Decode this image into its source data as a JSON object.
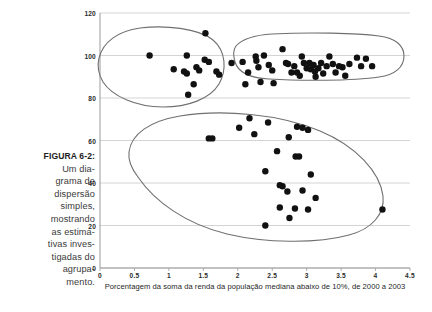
{
  "figure": {
    "caption_label": "FIGURA 6-2:",
    "caption_text": "Um diagrama de dispersão simples, mostrando as estimativas investigadas do agrupamento.",
    "caption_lines": [
      "Um dia-",
      "grama de",
      "dispersão",
      "simples,",
      "mostrando",
      "as estima-",
      "tivas inves-",
      "tigadas do",
      "agrupa-",
      "mento."
    ]
  },
  "colors": {
    "background": "#ffffff",
    "gridline": "#c9c9c9",
    "axis": "#9a9a9a",
    "point": "#111111",
    "cluster_outline": "#6f6f6f",
    "text": "#2b2b2b",
    "caption_text": "#3a3a3a"
  },
  "chart_data": {
    "type": "scatter",
    "title": "",
    "subtitle": "",
    "xlabel": "Porcentagem da soma da renda da população mediana abaixo de 10%, de 2000 a 2003",
    "ylabel": "",
    "xlim": [
      0,
      4.5
    ],
    "ylim": [
      0,
      120
    ],
    "xticks": [
      0,
      0.5,
      1,
      1.5,
      2,
      2.5,
      3,
      3.5,
      4,
      4.5
    ],
    "xtick_labels": [
      "0",
      "0.5",
      "1",
      "1.5",
      "2",
      "2.5",
      "3",
      "3.5",
      "4",
      "4.5"
    ],
    "yticks": [
      0,
      20,
      40,
      60,
      80,
      100,
      120
    ],
    "ytick_labels": [
      "0",
      "20",
      "40",
      "60",
      "80",
      "100",
      "120"
    ],
    "grid": "horizontal",
    "legend": "none",
    "marker": "filled-circle",
    "marker_size": 3.2,
    "series": [
      {
        "name": "estimativas",
        "points": [
          [
            0.72,
            100.0
          ],
          [
            1.53,
            110.5
          ],
          [
            1.26,
            100.0
          ],
          [
            1.52,
            98.0
          ],
          [
            1.58,
            97.0
          ],
          [
            1.91,
            96.5
          ],
          [
            2.07,
            97.0
          ],
          [
            1.07,
            93.5
          ],
          [
            1.22,
            92.5
          ],
          [
            1.26,
            91.5
          ],
          [
            1.4,
            94.5
          ],
          [
            1.44,
            93.0
          ],
          [
            1.69,
            92.5
          ],
          [
            1.73,
            91.0
          ],
          [
            2.15,
            92.0
          ],
          [
            1.36,
            86.5
          ],
          [
            2.11,
            86.5
          ],
          [
            1.28,
            81.5
          ],
          [
            2.26,
            99.5
          ],
          [
            2.27,
            97.5
          ],
          [
            2.3,
            94.5
          ],
          [
            2.33,
            87.5
          ],
          [
            2.38,
            100.0
          ],
          [
            2.45,
            95.5
          ],
          [
            2.5,
            93.0
          ],
          [
            2.52,
            87.0
          ],
          [
            2.65,
            103.0
          ],
          [
            2.7,
            96.5
          ],
          [
            2.73,
            96.0
          ],
          [
            2.78,
            92.0
          ],
          [
            2.82,
            95.0
          ],
          [
            2.86,
            92.0
          ],
          [
            2.9,
            90.5
          ],
          [
            2.93,
            99.5
          ],
          [
            2.96,
            96.5
          ],
          [
            3.0,
            94.0
          ],
          [
            3.04,
            96.5
          ],
          [
            3.06,
            93.5
          ],
          [
            3.1,
            95.5
          ],
          [
            3.12,
            92.5
          ],
          [
            3.13,
            90.0
          ],
          [
            3.17,
            94.0
          ],
          [
            3.21,
            96.5
          ],
          [
            3.24,
            91.5
          ],
          [
            3.29,
            95.0
          ],
          [
            3.33,
            99.5
          ],
          [
            3.38,
            96.0
          ],
          [
            3.42,
            92.0
          ],
          [
            3.47,
            95.0
          ],
          [
            3.52,
            94.5
          ],
          [
            3.56,
            90.5
          ],
          [
            3.62,
            96.0
          ],
          [
            3.73,
            99.0
          ],
          [
            3.79,
            95.0
          ],
          [
            3.86,
            98.5
          ],
          [
            3.95,
            95.0
          ],
          [
            1.58,
            61.0
          ],
          [
            1.63,
            61.0
          ],
          [
            2.02,
            66.0
          ],
          [
            2.24,
            63.0
          ],
          [
            2.17,
            70.5
          ],
          [
            2.44,
            68.5
          ],
          [
            2.86,
            66.5
          ],
          [
            2.94,
            66.0
          ],
          [
            3.02,
            65.0
          ],
          [
            2.74,
            61.5
          ],
          [
            2.57,
            55.0
          ],
          [
            2.84,
            52.5
          ],
          [
            2.89,
            52.5
          ],
          [
            2.4,
            45.5
          ],
          [
            3.06,
            44.0
          ],
          [
            2.61,
            39.0
          ],
          [
            2.65,
            38.5
          ],
          [
            2.72,
            36.0
          ],
          [
            2.94,
            36.5
          ],
          [
            3.13,
            33.0
          ],
          [
            2.61,
            28.5
          ],
          [
            2.83,
            28.0
          ],
          [
            3.02,
            27.5
          ],
          [
            2.75,
            23.5
          ],
          [
            2.4,
            20.0
          ],
          [
            4.1,
            27.5
          ]
        ]
      }
    ],
    "clusters": [
      {
        "name": "cluster-upper-left",
        "label": "",
        "shape": "blob",
        "n_points": 18
      },
      {
        "name": "cluster-upper-right",
        "label": "",
        "shape": "elongated-oval",
        "n_points": 38
      },
      {
        "name": "cluster-lower",
        "label": "",
        "shape": "large-blob",
        "n_points": 26
      }
    ],
    "annotations": []
  }
}
